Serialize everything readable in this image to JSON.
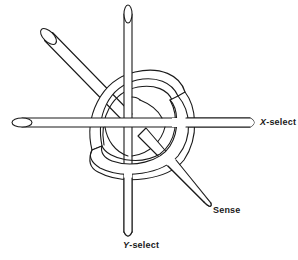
{
  "figure": {
    "background": "#ffffff",
    "stroke_color": "#1a1a1a"
  },
  "labels": {
    "x_select": {
      "var": "X",
      "suffix": "-select"
    },
    "y_select": {
      "var": "Y",
      "suffix": "-select"
    },
    "sense": {
      "text": "Sense"
    }
  },
  "elements": {
    "core_ring": "ferrite core (toroid)",
    "x_wire": "horizontal X-select wire",
    "y_wire": "vertical Y-select wire",
    "sense_wire": "diagonal sense wire"
  }
}
